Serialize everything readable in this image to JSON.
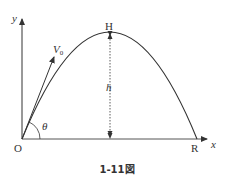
{
  "figure": {
    "caption": "1-11図",
    "labels": {
      "y_axis": "y",
      "x_axis": "x",
      "origin": "O",
      "peak": "H",
      "range_point": "R",
      "height": "h",
      "initial_velocity": "V",
      "initial_velocity_sub": "0",
      "angle": "θ"
    },
    "colors": {
      "line": "#333333",
      "background": "#ffffff"
    }
  }
}
